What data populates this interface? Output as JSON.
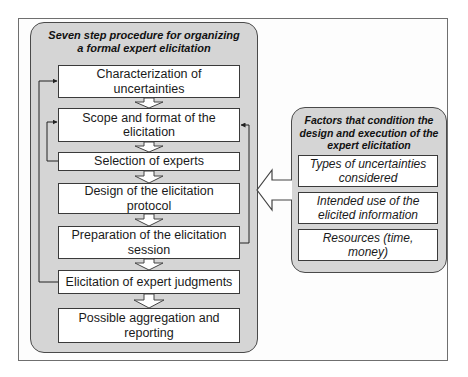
{
  "left_panel": {
    "title": "Seven step procedure for organizing a formal expert elicitation",
    "steps": [
      {
        "label": "Characterization of uncertainties"
      },
      {
        "label": "Scope and format of the elicitation"
      },
      {
        "label": "Selection of experts"
      },
      {
        "label": "Design of the elicitation protocol"
      },
      {
        "label": "Preparation of the elicitation session"
      },
      {
        "label": "Elicitation of expert judgments"
      },
      {
        "label": "Possible aggregation and reporting"
      }
    ]
  },
  "right_panel": {
    "title": "Factors that condition the design and execution of the expert elicitation",
    "factors": [
      {
        "label": "Types of uncertainties considered"
      },
      {
        "label": "Intended use of the elicited information"
      },
      {
        "label": "Resources (time, money)"
      }
    ]
  },
  "colors": {
    "panel_fill": "#d5d5d5",
    "box_fill": "#ffffff",
    "border": "#3a3a3a"
  }
}
